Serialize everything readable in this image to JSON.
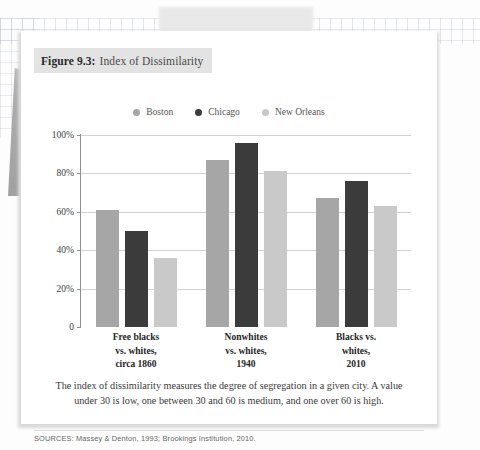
{
  "figure": {
    "number_label": "Figure 9.3:",
    "title": "Index of Dissimilarity",
    "caption": "The index of dissimilarity measures the degree of segregation in a given city. A value under 30 is low, one between 30 and 60 is medium, and one over 60 is high.",
    "sources": "SOURCES: Massey & Denton, 1993; Brookings Institution, 2010."
  },
  "colors": {
    "boston": "#a6a6a6",
    "chicago": "#3b3b3b",
    "new_orleans": "#c9c9c9",
    "gridline": "#d2d2d2",
    "axis": "#8e8e8e",
    "title_highlight": "#e3e3e3",
    "card_background": "#ffffff"
  },
  "chart_data": {
    "type": "bar",
    "title": "Index of Dissimilarity",
    "xlabel": "",
    "ylabel": "",
    "ylim": [
      0,
      100
    ],
    "ytick_labels": [
      "100%",
      "80%",
      "60%",
      "40%",
      "20%",
      "0"
    ],
    "ytick_values": [
      100,
      80,
      60,
      40,
      20,
      0
    ],
    "grid": true,
    "legend_position": "top-center",
    "categories": [
      [
        "Free blacks",
        "vs. whites,",
        "circa 1860"
      ],
      [
        "Nonwhites",
        "vs. whites,",
        "1940"
      ],
      [
        "Blacks vs.",
        "whites,",
        "2010"
      ]
    ],
    "series": [
      {
        "name": "Boston",
        "color": "#a6a6a6",
        "values": [
          61,
          87,
          67
        ]
      },
      {
        "name": "Chicago",
        "color": "#3b3b3b",
        "values": [
          50,
          96,
          76
        ]
      },
      {
        "name": "New Orleans",
        "color": "#c9c9c9",
        "values": [
          36,
          81,
          63
        ]
      }
    ]
  }
}
